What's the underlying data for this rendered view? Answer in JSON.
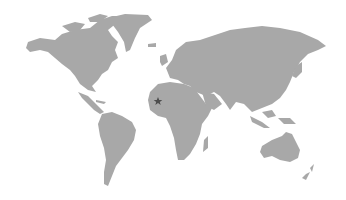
{
  "map": {
    "type": "world-map",
    "land_color": "#a8a8a8",
    "background_color": "#ffffff",
    "marker": {
      "shape": "star",
      "color": "#4d4d4d",
      "x": 158,
      "y": 101,
      "region": "West Africa"
    }
  }
}
